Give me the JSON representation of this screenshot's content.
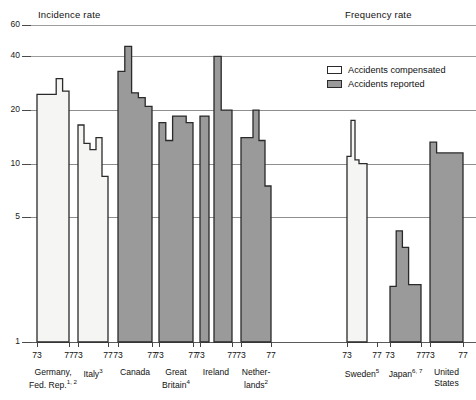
{
  "panels": {
    "left_title": "Incidence rate",
    "right_title": "Frequency rate"
  },
  "legend": {
    "items": [
      {
        "label": "Accidents compensated",
        "swatch": "white-square-icon",
        "color": "#ffffff"
      },
      {
        "label": "Accidents reported",
        "swatch": "gray-square-icon",
        "color": "#9a9a9a"
      }
    ]
  },
  "axis": {
    "y_ticks": [
      "60",
      "40",
      "20",
      "10",
      "5",
      "1"
    ],
    "y_values": [
      60,
      40,
      20,
      10,
      5,
      1
    ],
    "scale": "log",
    "x_tick_start": "73",
    "x_tick_end": "77"
  },
  "chart_data": {
    "type": "area",
    "subtitle": "",
    "xlabel": "",
    "ylabel": "",
    "ylim": [
      1,
      60
    ],
    "yscale": "log",
    "grid": true,
    "legend_position": "upper-right",
    "yticks": [
      1,
      5,
      10,
      20,
      40,
      60
    ],
    "x": [
      "73",
      "74",
      "75",
      "76",
      "77"
    ],
    "series": [
      {
        "name": "Germany, Fed. Rep.",
        "panel": "incidence",
        "fill": "compensated",
        "values": [
          24.5,
          24.5,
          24.5,
          30.0,
          25.5
        ]
      },
      {
        "name": "Italy",
        "panel": "incidence",
        "fill": "compensated",
        "values": [
          16.5,
          13.0,
          12.0,
          14.0,
          8.5
        ]
      },
      {
        "name": "Canada",
        "panel": "incidence",
        "fill": "reported",
        "values": [
          33.0,
          45.5,
          25.0,
          23.5,
          21.0
        ]
      },
      {
        "name": "Great Britain",
        "panel": "incidence",
        "fill": "reported",
        "values": [
          17.0,
          13.5,
          18.5,
          18.5,
          17.0
        ]
      },
      {
        "name": "Ireland A",
        "panel": "incidence",
        "fill": "reported",
        "values": [
          18.5,
          18.5,
          18.5,
          18.5,
          18.5
        ]
      },
      {
        "name": "Ireland B",
        "panel": "incidence",
        "fill": "reported",
        "values": [
          40.0,
          40.0,
          20.0,
          20.0,
          20.0
        ]
      },
      {
        "name": "Netherlands",
        "panel": "incidence",
        "fill": "reported",
        "values": [
          14.0,
          14.0,
          20.0,
          13.5,
          7.5
        ]
      },
      {
        "name": "Sweden",
        "panel": "frequency",
        "fill": "compensated",
        "values": [
          11.0,
          17.5,
          10.5,
          10.0,
          10.0
        ]
      },
      {
        "name": "Japan",
        "panel": "frequency",
        "fill": "reported",
        "values": [
          2.05,
          4.2,
          3.4,
          2.1,
          2.1
        ]
      },
      {
        "name": "United States",
        "panel": "frequency",
        "fill": "reported",
        "values": [
          13.2,
          11.5,
          11.5,
          11.5,
          11.5
        ]
      }
    ]
  },
  "groups": [
    {
      "label_lines": [
        "Germany,",
        "Fed. Rep."
      ],
      "footnote": "1, 2",
      "panel": "incidence"
    },
    {
      "label_lines": [
        "Italy"
      ],
      "footnote": "3",
      "panel": "incidence"
    },
    {
      "label_lines": [
        "Canada"
      ],
      "footnote": "",
      "panel": "incidence"
    },
    {
      "label_lines": [
        "Great",
        "Britain"
      ],
      "footnote": "4",
      "panel": "incidence"
    },
    {
      "label_lines": [
        "Ireland"
      ],
      "footnote": "",
      "panel": "incidence"
    },
    {
      "label_lines": [
        "Nether-",
        "lands"
      ],
      "footnote": "2",
      "panel": "incidence"
    },
    {
      "label_lines": [
        "Sweden"
      ],
      "footnote": "5",
      "panel": "frequency"
    },
    {
      "label_lines": [
        "Japan"
      ],
      "footnote": "6, 7",
      "panel": "frequency"
    },
    {
      "label_lines": [
        "United",
        "States"
      ],
      "footnote": "",
      "panel": "frequency"
    }
  ]
}
